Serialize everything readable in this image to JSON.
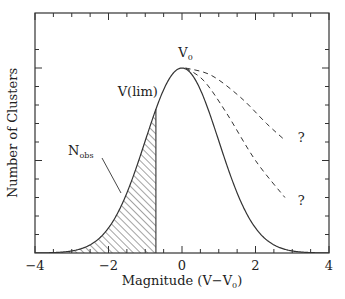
{
  "chart_data": {
    "type": "line",
    "title": "",
    "xlabel": "Magnitude (V−V",
    "xlabel_sub": "0",
    "xlabel_close": ")",
    "ylabel": "Number of Clusters",
    "xlim": [
      -4,
      4
    ],
    "ylim": [
      0,
      1.2
    ],
    "x_ticks": [
      -4,
      -2,
      0,
      2,
      4
    ],
    "x_tick_labels": [
      "−4",
      "−2",
      "0",
      "2",
      "4"
    ],
    "x_minor_step": 0.5,
    "y_tick_labels": [],
    "y_minor_step": 0.1,
    "y_major_ticks": [
      0.5,
      1.0
    ],
    "grid": false,
    "series": [
      {
        "name": "Gaussian luminosity function",
        "style": "solid",
        "mean": 0,
        "sigma": 1.0,
        "amplitude": 1.0,
        "x_range": [
          -4,
          4
        ]
      },
      {
        "name": "Alternative faint-end (upper)",
        "style": "dashed",
        "points": [
          [
            0.1,
            1.0
          ],
          [
            0.8,
            0.96
          ],
          [
            1.6,
            0.84
          ],
          [
            2.3,
            0.7
          ],
          [
            2.8,
            0.61
          ]
        ]
      },
      {
        "name": "Alternative faint-end (lower)",
        "style": "dashed",
        "points": [
          [
            0.1,
            1.0
          ],
          [
            0.6,
            0.93
          ],
          [
            1.2,
            0.76
          ],
          [
            2.0,
            0.5
          ],
          [
            2.8,
            0.3
          ]
        ]
      }
    ],
    "shaded_region": {
      "name": "N_obs",
      "from": -4,
      "to": -0.71,
      "pattern": "diagonal-hatch"
    },
    "annotations": [
      {
        "text": "V",
        "sub": "0",
        "x": -0.1,
        "y": 1.06
      },
      {
        "text": "V(lim)",
        "x": -1.75,
        "y": 0.85
      },
      {
        "text": "N",
        "sub": "obs",
        "x": -3.1,
        "y": 0.53
      },
      {
        "text": "?",
        "x": 3.15,
        "y": 0.6
      },
      {
        "text": "?",
        "x": 3.15,
        "y": 0.26
      }
    ]
  }
}
